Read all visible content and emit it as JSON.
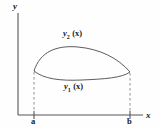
{
  "figure": {
    "kind": "region-between-two-curves",
    "background_color": "#fefefe",
    "ink_color": "#1a1a1a",
    "axis_color": "#555555",
    "curve_color": "#4a4a4a",
    "dash_color": "#777777",
    "axes": {
      "y_label": "y",
      "x_label": "x",
      "origin_px": [
        18,
        115
      ],
      "x_axis_end_px": [
        143,
        115
      ],
      "y_axis_top_px": [
        18,
        13
      ]
    },
    "bounds": {
      "left_label": "a",
      "right_label": "b",
      "left_x_px": 34,
      "right_x_px": 130,
      "tick_top_px": 111,
      "tick_bottom_px": 119
    },
    "curves": {
      "upper": {
        "label_base": "y",
        "label_sub": "2",
        "label_arg": "(x)",
        "path": "M 34,71 C 40,52 56,45 78,47 C 100,49 118,58 130,72"
      },
      "lower": {
        "label_base": "y",
        "label_sub": "1",
        "label_arg": "(x)",
        "path": "M 34,71 C 44,79 60,81 82,80 C 104,79 122,78 130,72"
      }
    },
    "dashed_drop_lines": [
      {
        "name": "drop-line-a",
        "path": "M 34,72 L 34,112"
      },
      {
        "name": "drop-line-b",
        "path": "M 130,73 L 130,112"
      }
    ]
  }
}
